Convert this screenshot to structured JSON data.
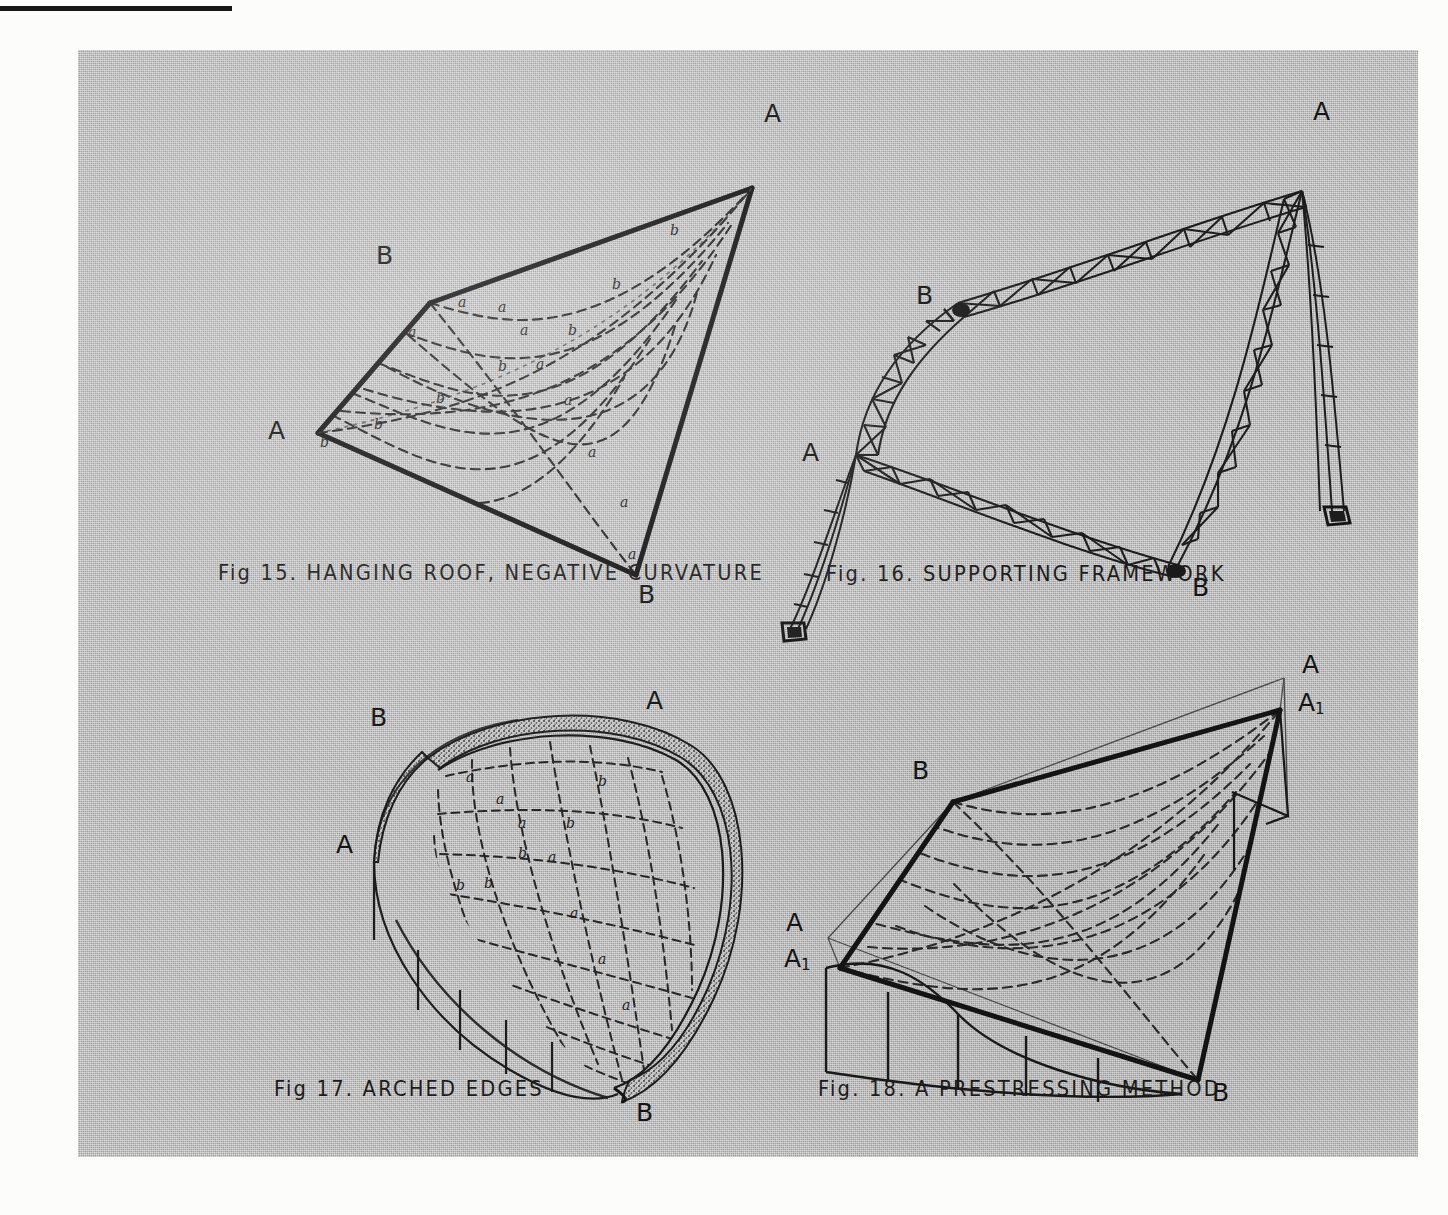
{
  "plate": {
    "background_color": "#b7b7b7",
    "paper_color": "#fcfcfb",
    "ink_color": "#1a1a1a"
  },
  "figures": [
    {
      "id": "fig15",
      "caption": "Fig 15.  HANGING ROOF, NEGATIVE CURVATURE",
      "number": "Fig 15.",
      "title": "HANGING ROOF, NEGATIVE CURVATURE",
      "corner_labels": [
        {
          "text": "A",
          "position": "top-right"
        },
        {
          "text": "B",
          "position": "upper-left"
        },
        {
          "text": "A",
          "position": "left"
        },
        {
          "text": "B",
          "position": "bottom"
        }
      ],
      "net_letters": [
        "a",
        "a",
        "b",
        "b",
        "a",
        "b",
        "a",
        "b",
        "a",
        "b",
        "b",
        "a",
        "a",
        "b",
        "a",
        "a"
      ],
      "description": "Saddle-shaped hanging roof with dashed cable net, negative gaussian curvature"
    },
    {
      "id": "fig16",
      "caption": "Fig. 16.  SUPPORTING FRAMEWORK",
      "number": "Fig. 16.",
      "title": "SUPPORTING FRAMEWORK",
      "corner_labels": [
        {
          "text": "A",
          "position": "top-right"
        },
        {
          "text": "B",
          "position": "upper-left"
        },
        {
          "text": "A",
          "position": "left"
        },
        {
          "text": "B",
          "position": "bottom-right"
        }
      ],
      "description": "Triangulated edge trusses with guyed masts at the two A corners"
    },
    {
      "id": "fig17",
      "caption": "Fig 17.   ARCHED EDGES",
      "number": "Fig 17.",
      "title": "ARCHED EDGES",
      "corner_labels": [
        {
          "text": "A",
          "position": "top-right"
        },
        {
          "text": "B",
          "position": "top-left"
        },
        {
          "text": "A",
          "position": "left"
        },
        {
          "text": "B",
          "position": "bottom-right"
        }
      ],
      "net_letters": [
        "a",
        "a",
        "b",
        "a",
        "b",
        "b",
        "a",
        "b",
        "b",
        "a",
        "a",
        "a"
      ],
      "description": "Hanging net carried on stippled arched boundary members over a drum wall"
    },
    {
      "id": "fig18",
      "caption": "Fig. 18.  A PRESTRESSING METHOD",
      "number": "Fig. 18.",
      "title": "A PRESTRESSING METHOD",
      "corner_labels": [
        {
          "text": "A",
          "subscript": "",
          "position": "top-right-upper"
        },
        {
          "text": "A",
          "subscript": "1",
          "position": "top-right-lower"
        },
        {
          "text": "B",
          "subscript": "",
          "position": "upper-left"
        },
        {
          "text": "A",
          "subscript": "",
          "position": "left-upper"
        },
        {
          "text": "A",
          "subscript": "1",
          "position": "left-lower"
        },
        {
          "text": "B",
          "subscript": "",
          "position": "bottom-right"
        }
      ],
      "description": "Net prestressed by pulling corners A down to positions A1"
    }
  ]
}
